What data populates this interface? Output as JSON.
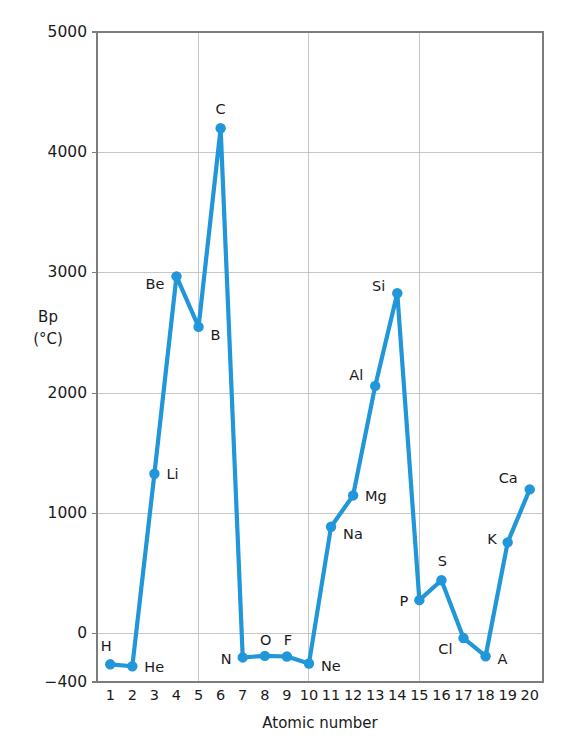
{
  "chart_data": {
    "type": "line",
    "title": "",
    "xlabel": "Atomic number",
    "ylabel": "Bp (°C)",
    "ylabel_lines": [
      "Bp",
      "(°C)"
    ],
    "xlim": [
      0.4,
      20.6
    ],
    "ylim": [
      -400,
      5000
    ],
    "grid": true,
    "legend": "none",
    "series_color": "#2196d8",
    "x_ticks": [
      1,
      2,
      3,
      4,
      5,
      6,
      7,
      8,
      9,
      10,
      11,
      12,
      13,
      14,
      15,
      16,
      17,
      18,
      19,
      20
    ],
    "x_tick_labels": [
      "1",
      "2",
      "3",
      "4",
      "5",
      "6",
      "7",
      "8",
      "9",
      "10",
      "11",
      "12",
      "13",
      "14",
      "15",
      "16",
      "17",
      "18",
      "19",
      "20"
    ],
    "y_ticks": [
      -400,
      0,
      1000,
      2000,
      3000,
      4000,
      5000
    ],
    "y_tick_labels": [
      "−400",
      "0",
      "1000",
      "2000",
      "3000",
      "4000",
      "5000"
    ],
    "y_gridlines": [
      0,
      1000,
      2000,
      3000,
      4000
    ],
    "x_gridlines": [
      5,
      10,
      15
    ],
    "x": [
      1,
      2,
      3,
      4,
      5,
      6,
      7,
      8,
      9,
      10,
      11,
      12,
      13,
      14,
      15,
      16,
      17,
      18,
      19,
      20
    ],
    "values": [
      -253,
      -269,
      1330,
      2970,
      2550,
      4200,
      -196,
      -183,
      -188,
      -246,
      890,
      1150,
      2060,
      2830,
      280,
      445,
      -35,
      -186,
      760,
      1200
    ],
    "point_labels": [
      "H",
      "He",
      "Li",
      "Be",
      "B",
      "C",
      "N",
      "O",
      "F",
      "Ne",
      "Na",
      "Mg",
      "Al",
      "Si",
      "P",
      "S",
      "Cl",
      "A",
      "K",
      "Ca"
    ],
    "label_offsets": [
      {
        "dx": -4,
        "dy": -13,
        "anchor": "middle"
      },
      {
        "dx": 12,
        "dy": 6,
        "anchor": "start"
      },
      {
        "dx": 12,
        "dy": 5,
        "anchor": "start"
      },
      {
        "dx": -12,
        "dy": 13,
        "anchor": "end"
      },
      {
        "dx": 12,
        "dy": 13,
        "anchor": "start"
      },
      {
        "dx": 0,
        "dy": -14,
        "anchor": "middle"
      },
      {
        "dx": -11,
        "dy": 7,
        "anchor": "end"
      },
      {
        "dx": 1,
        "dy": -11,
        "anchor": "middle"
      },
      {
        "dx": 1,
        "dy": -11,
        "anchor": "middle"
      },
      {
        "dx": 12,
        "dy": 8,
        "anchor": "start"
      },
      {
        "dx": 12,
        "dy": 12,
        "anchor": "start"
      },
      {
        "dx": 12,
        "dy": 6,
        "anchor": "start"
      },
      {
        "dx": -12,
        "dy": -6,
        "anchor": "end"
      },
      {
        "dx": -12,
        "dy": -2,
        "anchor": "end"
      },
      {
        "dx": -11,
        "dy": 6,
        "anchor": "end"
      },
      {
        "dx": 1,
        "dy": -14,
        "anchor": "middle"
      },
      {
        "dx": -11,
        "dy": 16,
        "anchor": "end"
      },
      {
        "dx": 12,
        "dy": 8,
        "anchor": "start"
      },
      {
        "dx": -11,
        "dy": 2,
        "anchor": "end"
      },
      {
        "dx": -12,
        "dy": -6,
        "anchor": "end"
      }
    ]
  }
}
